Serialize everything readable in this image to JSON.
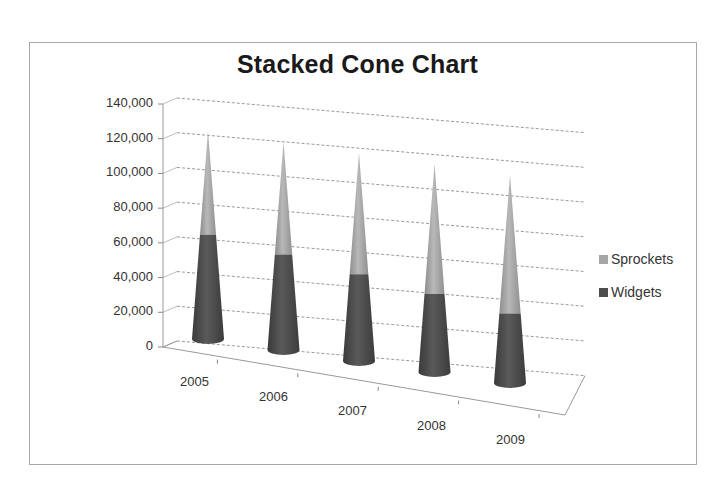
{
  "chart_data": {
    "type": "bar",
    "subtype": "3d-stacked-cone",
    "title": "Stacked Cone Chart",
    "categories": [
      "2005",
      "2006",
      "2007",
      "2008",
      "2009"
    ],
    "series": [
      {
        "name": "Widgets",
        "values": [
          60000,
          55000,
          50000,
          45000,
          40000
        ],
        "color": "#4d4d4d"
      },
      {
        "name": "Sprockets",
        "values": [
          60000,
          65000,
          70000,
          75000,
          80000
        ],
        "color": "#a6a6a6"
      }
    ],
    "xlabel": "",
    "ylabel": "",
    "ylim": [
      0,
      140000
    ],
    "yticks": [
      "140,000",
      "120,000",
      "100,000",
      "80,000",
      "60,000",
      "40,000",
      "20,000",
      "0"
    ],
    "grid": true,
    "legend_position": "right"
  },
  "legend": {
    "items": [
      {
        "label": "Sprockets",
        "color": "#a6a6a6"
      },
      {
        "label": "Widgets",
        "color": "#4d4d4d"
      }
    ]
  }
}
